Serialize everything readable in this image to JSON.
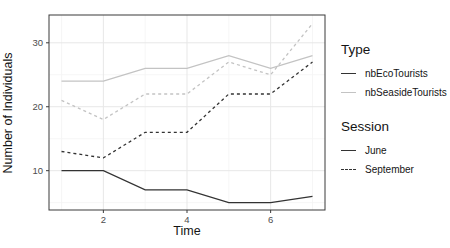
{
  "chart_data": {
    "type": "line",
    "title": "",
    "xlabel": "Time",
    "ylabel": "Number of Individuals",
    "x": [
      1,
      2,
      3,
      4,
      5,
      6,
      7
    ],
    "series": [
      {
        "name": "nbEcoTourists June",
        "type": "nbEcoTourists",
        "session": "June",
        "dash": "solid",
        "color": "#333333",
        "values": [
          10,
          10,
          7,
          7,
          5,
          5,
          6
        ]
      },
      {
        "name": "nbEcoTourists September",
        "type": "nbEcoTourists",
        "session": "September",
        "dash": "dashed",
        "color": "#333333",
        "values": [
          13,
          12,
          16,
          16,
          22,
          22,
          27
        ]
      },
      {
        "name": "nbSeasideTourists June",
        "type": "nbSeasideTourists",
        "session": "June",
        "dash": "solid",
        "color": "#c3c3c3",
        "values": [
          24,
          24,
          26,
          26,
          28,
          26,
          28
        ]
      },
      {
        "name": "nbSeasideTourists September",
        "type": "nbSeasideTourists",
        "session": "September",
        "dash": "dashed",
        "color": "#c3c3c3",
        "values": [
          21,
          18,
          22,
          22,
          27,
          25,
          33
        ]
      }
    ],
    "axes": {
      "xlim": [
        0.7,
        7.3
      ],
      "ylim": [
        3.85,
        34.35
      ],
      "x_ticks": [
        2,
        4,
        6
      ],
      "x_minor_grid": [
        1,
        3,
        5,
        7
      ],
      "y_ticks": [
        10,
        20,
        30
      ],
      "y_minor_grid": [
        5,
        15,
        25
      ],
      "grid": true,
      "legend_position": "right"
    },
    "colors": {
      "dark_line": "#333333",
      "light_line": "#c3c3c3",
      "grid_major": "#e7e7e7",
      "grid_minor": "#f4f4f4",
      "panel_border": "#3a3a3a",
      "tick_text": "#4d4d4d",
      "background": "#ffffff"
    }
  },
  "legend": {
    "type": {
      "title": "Type",
      "items": [
        {
          "label": "nbEcoTourists",
          "color": "#333333",
          "style": "solid"
        },
        {
          "label": "nbSeasideTourists",
          "color": "#c3c3c3",
          "style": "solid"
        }
      ]
    },
    "session": {
      "title": "Session",
      "items": [
        {
          "label": "June",
          "color": "#333333",
          "style": "solid"
        },
        {
          "label": "September",
          "color": "#333333",
          "style": "dashed"
        }
      ]
    }
  }
}
